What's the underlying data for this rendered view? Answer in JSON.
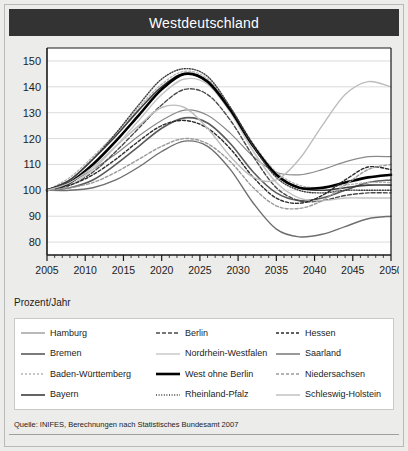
{
  "title": "Westdeutschland",
  "unit_label": "Prozent/Jahr",
  "source": "Quelle: INIFES, Berechnungen nach Statistisches Bundesamt 2007",
  "legend": {
    "items": [
      {
        "label": "Hamburg",
        "key": "hamburg",
        "color": "#8a8a8a",
        "dash": "none",
        "width": 1.2
      },
      {
        "label": "Bremen",
        "key": "bremen",
        "color": "#5a5a5a",
        "dash": "none",
        "width": 1.6
      },
      {
        "label": "Baden-Württemberg",
        "key": "baden_wuerttemberg",
        "color": "#b4b4b4",
        "dash": "2,2",
        "width": 1.3
      },
      {
        "label": "Bayern",
        "key": "bayern",
        "color": "#3d3d3d",
        "dash": "none",
        "width": 1.6
      },
      {
        "label": "Berlin",
        "key": "berlin",
        "color": "#4a4a4a",
        "dash": "4,2",
        "width": 1.4
      },
      {
        "label": "Nordrhein-Westfalen",
        "key": "nordrhein_westfalen",
        "color": "#c4c4c4",
        "dash": "none",
        "width": 1.4
      },
      {
        "label": "West ohne Berlin",
        "key": "west_ohne_berlin",
        "color": "#000000",
        "dash": "none",
        "width": 2.6
      },
      {
        "label": "Rheinland-Pfalz",
        "key": "rheinland_pfalz",
        "color": "#3d3d3d",
        "dash": "1,1.6",
        "width": 1.4
      },
      {
        "label": "Hessen",
        "key": "hessen",
        "color": "#2b2b2b",
        "dash": "3,2",
        "width": 1.4
      },
      {
        "label": "Saarland",
        "key": "saarland",
        "color": "#6e6e6e",
        "dash": "none",
        "width": 1.4
      },
      {
        "label": "Niedersachsen",
        "key": "niedersachsen",
        "color": "#9a9a9a",
        "dash": "3,2",
        "width": 1.4
      },
      {
        "label": "Schleswig-Holstein",
        "key": "schleswig_holstein",
        "color": "#bdbdbd",
        "dash": "none",
        "width": 1.4
      }
    ]
  },
  "chart_data": {
    "type": "line",
    "title": "Westdeutschland",
    "xlabel": "",
    "ylabel": "Prozent/Jahr",
    "xlim": [
      2005,
      2050
    ],
    "ylim": [
      75,
      155
    ],
    "grid": true,
    "legend_position": "below",
    "xticks": [
      2005,
      2010,
      2015,
      2020,
      2025,
      2030,
      2035,
      2040,
      2045,
      2050
    ],
    "yticks": [
      80,
      90,
      100,
      110,
      120,
      130,
      140,
      150
    ],
    "minor_xtick_interval": 1,
    "x": [
      2005,
      2008,
      2011,
      2014,
      2017,
      2020,
      2023,
      2026,
      2029,
      2032,
      2035,
      2038,
      2041,
      2044,
      2047,
      2050
    ],
    "series": [
      {
        "name": "Hamburg",
        "key": "hamburg",
        "values": [
          100,
          103,
          108,
          114,
          121,
          127,
          131,
          129,
          122,
          113,
          107,
          106,
          108,
          111,
          113,
          113
        ]
      },
      {
        "name": "Bremen",
        "key": "bremen",
        "values": [
          100,
          101,
          104,
          110,
          117,
          124,
          128,
          126,
          118,
          107,
          99,
          96,
          97,
          100,
          103,
          104
        ]
      },
      {
        "name": "Baden-Württemberg",
        "key": "baden_wuerttemberg",
        "values": [
          100,
          105,
          113,
          122,
          132,
          141,
          146,
          143,
          132,
          118,
          107,
          102,
          101,
          102,
          103,
          103
        ]
      },
      {
        "name": "Bayern",
        "key": "bayern",
        "values": [
          100,
          104,
          112,
          121,
          131,
          140,
          145,
          142,
          131,
          117,
          106,
          101,
          100,
          101,
          102,
          102
        ]
      },
      {
        "name": "Berlin",
        "key": "berlin",
        "values": [
          100,
          102,
          107,
          115,
          124,
          133,
          139,
          137,
          127,
          113,
          101,
          96,
          96,
          98,
          99,
          99
        ]
      },
      {
        "name": "Nordrhein-Westfalen",
        "key": "nordrhein_westfalen",
        "values": [
          100,
          102,
          108,
          117,
          127,
          137,
          143,
          141,
          130,
          115,
          103,
          97,
          96,
          97,
          97,
          97
        ]
      },
      {
        "name": "West ohne Berlin",
        "key": "west_ohne_berlin",
        "values": [
          100,
          103,
          110,
          119,
          129,
          139,
          145,
          142,
          131,
          117,
          106,
          101,
          101,
          103,
          105,
          106
        ]
      },
      {
        "name": "Rheinland-Pfalz",
        "key": "rheinland_pfalz",
        "values": [
          100,
          104,
          112,
          122,
          133,
          143,
          147,
          144,
          132,
          117,
          105,
          100,
          99,
          100,
          100,
          100
        ]
      },
      {
        "name": "Hessen",
        "key": "hessen",
        "values": [
          100,
          102,
          106,
          112,
          119,
          125,
          127,
          124,
          116,
          105,
          97,
          95,
          98,
          104,
          109,
          108
        ]
      },
      {
        "name": "Saarland",
        "key": "saarland",
        "values": [
          100,
          100,
          101,
          104,
          109,
          115,
          119,
          117,
          108,
          95,
          85,
          82,
          83,
          86,
          89,
          90
        ]
      },
      {
        "name": "Niedersachsen",
        "key": "niedersachsen",
        "values": [
          100,
          101,
          103,
          107,
          112,
          117,
          120,
          118,
          111,
          101,
          94,
          93,
          96,
          102,
          108,
          110
        ]
      },
      {
        "name": "Schleswig-Holstein",
        "key": "schleswig_holstein",
        "values": [
          100,
          103,
          109,
          117,
          125,
          132,
          132,
          124,
          113,
          105,
          104,
          112,
          125,
          137,
          142,
          140
        ]
      }
    ]
  }
}
